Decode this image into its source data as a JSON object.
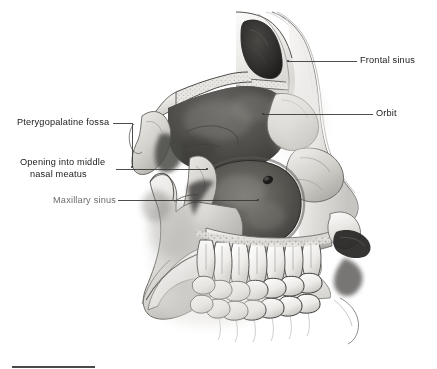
{
  "figure": {
    "background_color": "#ffffff",
    "width": 437,
    "height": 369,
    "label_color": "#1a1a1a",
    "muted_label_color": "#6e6e6e",
    "leader_line_color": "#3a3a3a",
    "scalebar_color": "#4a4a4a"
  },
  "labels": [
    {
      "id": "frontal-sinus",
      "text": "Frontal sinus",
      "side": "right",
      "muted": false,
      "text_x": 360,
      "text_y": 55,
      "leader": {
        "x1": 288,
        "y1": 61,
        "x2": 357,
        "y2": 61
      },
      "dot": {
        "x": 288,
        "y": 61
      }
    },
    {
      "id": "orbit",
      "text": "Orbit",
      "side": "right",
      "muted": false,
      "text_x": 376,
      "text_y": 108,
      "leader": {
        "x1": 263,
        "y1": 114,
        "x2": 373,
        "y2": 114
      },
      "dot": {
        "x": 263,
        "y": 114
      }
    },
    {
      "id": "pterygopalatine-fossa",
      "text": "Pterygopalatine fossa",
      "side": "left",
      "muted": false,
      "text_x": 17,
      "text_y": 117,
      "leader_path": "M 113 123 L 132 123 L 132 167",
      "dot": {
        "x": 132,
        "y": 167
      }
    },
    {
      "id": "opening-into-middle-nasal-meatus",
      "text": "Opening into middle\nnasal meatus",
      "line1": "Opening into middle",
      "line2": "nasal meatus",
      "side": "left",
      "muted": false,
      "text_x": 20,
      "text_y": 157,
      "leader": {
        "x1": 116,
        "y1": 169,
        "x2": 207,
        "y2": 169
      },
      "dot": {
        "x": 207,
        "y": 169
      }
    },
    {
      "id": "maxillary-sinus",
      "text": "Maxillary sinus",
      "side": "left",
      "muted": true,
      "text_x": 53,
      "text_y": 195,
      "leader": {
        "x1": 118,
        "y1": 200,
        "x2": 258,
        "y2": 200
      },
      "dot": {
        "x": 258,
        "y": 200
      }
    }
  ],
  "scalebar": {
    "name": "scale-bar",
    "x": 12,
    "y": 366,
    "width": 83
  }
}
